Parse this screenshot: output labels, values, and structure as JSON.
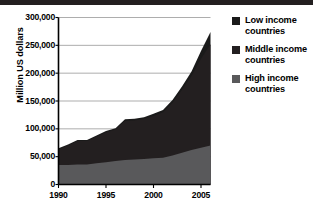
{
  "figure": {
    "top_rule_color": "#231f20",
    "background": "#ffffff"
  },
  "legend": {
    "position": "right",
    "items": [
      {
        "label_line1": "Low income",
        "label_line2": "countries",
        "color": "#1a1a1a",
        "swatch_name": "legend-swatch-low-income"
      },
      {
        "label_line1": "Middle income",
        "label_line2": "countries",
        "color": "#231f20",
        "swatch_name": "legend-swatch-middle-income"
      },
      {
        "label_line1": "High income",
        "label_line2": "countries",
        "color": "#59595b",
        "swatch_name": "legend-swatch-high-income"
      }
    ]
  },
  "axes": {
    "ylabel": "Million US dollars",
    "yticks": [
      "0",
      "50,000",
      "100,000",
      "150,000",
      "200,000",
      "250,000",
      "300,000"
    ],
    "xticks": [
      "1990",
      "1995",
      "2000",
      "2005"
    ]
  },
  "chart_data": {
    "type": "area",
    "stacked": true,
    "title": "",
    "subtitle": "",
    "xlabel": "",
    "ylabel": "Million US dollars",
    "xlim": [
      1990,
      2006
    ],
    "ylim": [
      0,
      300000
    ],
    "ytick_values": [
      0,
      50000,
      100000,
      150000,
      200000,
      250000,
      300000
    ],
    "xtick_values": [
      1990,
      1995,
      2000,
      2005
    ],
    "grid": "horizontal",
    "legend_position": "right",
    "x": [
      1990,
      1991,
      1992,
      1993,
      1994,
      1995,
      1996,
      1997,
      1998,
      1999,
      2000,
      2001,
      2002,
      2003,
      2004,
      2005,
      2006
    ],
    "series": [
      {
        "name": "High income countries",
        "color": "#59595b",
        "values": [
          35000,
          35000,
          36000,
          36000,
          38000,
          40000,
          42000,
          44000,
          45000,
          46000,
          47000,
          48000,
          52000,
          57000,
          62000,
          66000,
          70000
        ]
      },
      {
        "name": "Middle income countries",
        "color": "#231f20",
        "values": [
          28000,
          35000,
          42000,
          42000,
          48000,
          54000,
          57000,
          70000,
          70000,
          72000,
          76000,
          82000,
          95000,
          113000,
          133000,
          160000,
          182000
        ]
      },
      {
        "name": "Low income countries",
        "color": "#1a1a1a",
        "values": [
          2000,
          2000,
          2000,
          2000,
          2000,
          2000,
          2000,
          3000,
          3000,
          3000,
          4000,
          4000,
          5000,
          6000,
          8000,
          14000,
          22000
        ]
      }
    ],
    "totals": [
      65000,
      72000,
      80000,
      80000,
      88000,
      96000,
      101000,
      117000,
      118000,
      121000,
      127000,
      134000,
      152000,
      176000,
      203000,
      240000,
      274000
    ]
  }
}
